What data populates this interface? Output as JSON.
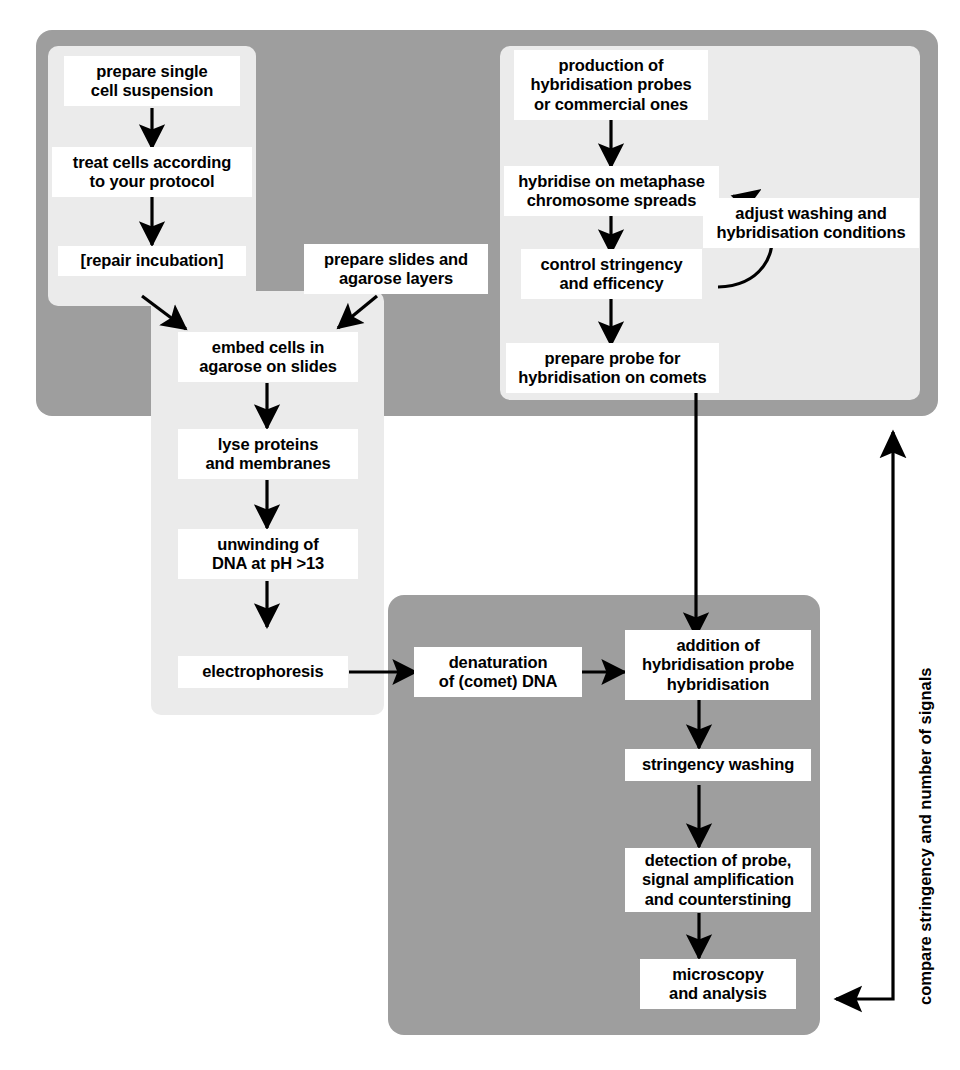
{
  "diagram": {
    "colors": {
      "panel_dark": "#9e9e9e",
      "panel_light": "#ebebeb",
      "node_fill": "#ffffff",
      "stroke": "#000000",
      "background": "#ffffff"
    },
    "groups": [
      {
        "id": "group-outer-top",
        "kind": "dark",
        "label": "upper preparation group"
      },
      {
        "id": "group-cell-prep",
        "kind": "light",
        "label": "cell preparation group"
      },
      {
        "id": "group-probe-prep",
        "kind": "light",
        "label": "probe preparation group"
      },
      {
        "id": "group-comet-assay",
        "kind": "light",
        "label": "comet assay group"
      },
      {
        "id": "group-fish",
        "kind": "dark",
        "label": "hybridisation and detection group"
      }
    ],
    "nodes": [
      {
        "id": "prepare-single-cell-suspension",
        "label": "prepare single\ncell suspension"
      },
      {
        "id": "treat-cells-according-to-your-protocol",
        "label": "treat cells according\nto your protocol"
      },
      {
        "id": "repair-incubation",
        "label": "[repair incubation]"
      },
      {
        "id": "prepare-slides-and-agarose-layers",
        "label": "prepare slides and\nagarose layers"
      },
      {
        "id": "embed-cells-in-agarose-on-slides",
        "label": "embed cells in\nagarose on slides"
      },
      {
        "id": "lyse-proteins-and-membranes",
        "label": "lyse proteins\nand membranes"
      },
      {
        "id": "unwinding-of-dna",
        "label": "unwinding of\nDNA at pH >13"
      },
      {
        "id": "electrophoresis",
        "label": "electrophoresis"
      },
      {
        "id": "production-of-hybridisation-probes",
        "label": "production of\nhybridisation probes\nor commercial ones"
      },
      {
        "id": "hybridise-on-metaphase-chromosome-spreads",
        "label": "hybridise on metaphase\nchromosome spreads"
      },
      {
        "id": "control-stringency-and-efficency",
        "label": "control stringency\nand efficency"
      },
      {
        "id": "prepare-probe-for-hybridisation-on-comets",
        "label": "prepare probe for\nhybridisation on comets"
      },
      {
        "id": "adjust-washing-and-hybridisation-conditions",
        "label": "adjust washing and\nhybridisation conditions"
      },
      {
        "id": "denaturation-of-comet-dna",
        "label": "denaturation\nof (comet) DNA"
      },
      {
        "id": "addition-of-hybridisation-probe",
        "label": "addition of\nhybridisation probe\nhybridisation"
      },
      {
        "id": "stringency-washing",
        "label": "stringency washing"
      },
      {
        "id": "detection-of-probe",
        "label": "detection of probe,\nsignal amplification\nand counterstining"
      },
      {
        "id": "microscopy-and-analysis",
        "label": "microscopy\nand analysis"
      }
    ],
    "feedback_label": "compare stringency and number of signals",
    "edges": [
      {
        "from": "prepare-single-cell-suspension",
        "to": "treat-cells-according-to-your-protocol"
      },
      {
        "from": "treat-cells-according-to-your-protocol",
        "to": "repair-incubation"
      },
      {
        "from": "repair-incubation",
        "to": "embed-cells-in-agarose-on-slides"
      },
      {
        "from": "prepare-slides-and-agarose-layers",
        "to": "embed-cells-in-agarose-on-slides"
      },
      {
        "from": "embed-cells-in-agarose-on-slides",
        "to": "lyse-proteins-and-membranes"
      },
      {
        "from": "lyse-proteins-and-membranes",
        "to": "unwinding-of-dna"
      },
      {
        "from": "unwinding-of-dna",
        "to": "electrophoresis"
      },
      {
        "from": "electrophoresis",
        "to": "denaturation-of-comet-dna"
      },
      {
        "from": "denaturation-of-comet-dna",
        "to": "addition-of-hybridisation-probe"
      },
      {
        "from": "production-of-hybridisation-probes",
        "to": "hybridise-on-metaphase-chromosome-spreads"
      },
      {
        "from": "hybridise-on-metaphase-chromosome-spreads",
        "to": "control-stringency-and-efficency"
      },
      {
        "from": "control-stringency-and-efficency",
        "to": "prepare-probe-for-hybridisation-on-comets"
      },
      {
        "from": "adjust-washing-and-hybridisation-conditions",
        "to": "hybridise-on-metaphase-chromosome-spreads",
        "style": "curved"
      },
      {
        "from": "prepare-probe-for-hybridisation-on-comets",
        "to": "addition-of-hybridisation-probe"
      },
      {
        "from": "addition-of-hybridisation-probe",
        "to": "stringency-washing"
      },
      {
        "from": "stringency-washing",
        "to": "detection-of-probe"
      },
      {
        "from": "detection-of-probe",
        "to": "microscopy-and-analysis"
      },
      {
        "from": "microscopy-and-analysis",
        "to": "group-probe-prep",
        "style": "feedback",
        "label": "compare stringency and number of signals"
      }
    ]
  }
}
